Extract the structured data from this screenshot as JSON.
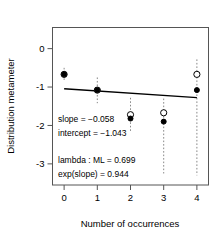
{
  "chart_data": {
    "type": "scatter",
    "title": "",
    "xlabel": "Number of occurrences",
    "ylabel": "Distribution metameter",
    "x": [
      0,
      1,
      2,
      3,
      4
    ],
    "xticks": [
      "0",
      "1",
      "2",
      "3",
      "4"
    ],
    "yticks": [
      "0",
      "-1",
      "-2",
      "-3"
    ],
    "ytickvalues": [
      0,
      -1,
      -2,
      -3
    ],
    "xlim": [
      -0.35,
      4.35
    ],
    "ylim": [
      -3.55,
      0.55
    ],
    "grid": false,
    "legend": null,
    "series": [
      {
        "name": "observed",
        "marker": "filled-circle",
        "values": [
          -0.67,
          -1.08,
          -1.82,
          -1.9,
          -1.08
        ]
      },
      {
        "name": "expected",
        "marker": "open-circle",
        "values": [
          -0.67,
          -1.08,
          -1.72,
          -1.67,
          -0.67
        ]
      }
    ],
    "error_bars": [
      {
        "x": 0,
        "low": -0.85,
        "high": -0.5
      },
      {
        "x": 1,
        "low": -1.42,
        "high": -0.75
      },
      {
        "x": 2,
        "low": -2.15,
        "high": -1.28
      },
      {
        "x": 3,
        "low": -3.25,
        "high": -1.3
      },
      {
        "x": 4,
        "low": -3.3,
        "high": -0.28
      }
    ],
    "fit_line": {
      "slope": -0.058,
      "intercept": -1.043,
      "x_start": 0,
      "x_end": 4,
      "y_start": -1.043,
      "y_end": -1.275
    },
    "annotations": [
      "slope = −0.058",
      "intercept = −1.043",
      "lambda : ML = 0.699",
      "exp(slope) = 0.944"
    ]
  },
  "colors": {
    "axis": "#555555",
    "point": "#000000",
    "errorbar": "#888888",
    "fitline": "#000000",
    "background": "#ffffff"
  }
}
